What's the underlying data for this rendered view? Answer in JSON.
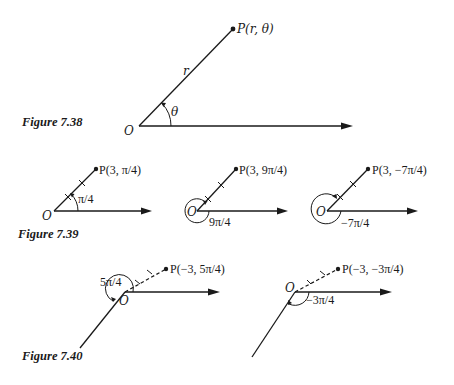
{
  "figures": {
    "fig738": {
      "caption": "Figure 7.38",
      "origin_label": "O",
      "point_label": "P(r, θ)",
      "radius_label": "r",
      "angle_label": "θ"
    },
    "fig739": {
      "caption": "Figure 7.39",
      "panels": [
        {
          "origin_label": "O",
          "point_label": "P(3, π/4)",
          "angle_label": "π/4"
        },
        {
          "origin_label": "O",
          "point_label": "P(3, 9π/4)",
          "angle_label": "9π/4"
        },
        {
          "origin_label": "O",
          "point_label": "P(3, −7π/4)",
          "angle_label": "−7π/4"
        }
      ]
    },
    "fig740": {
      "caption": "Figure 7.40",
      "panels": [
        {
          "origin_label": "O",
          "point_label": "P(−3, 5π/4)",
          "angle_label": "5π/4"
        },
        {
          "origin_label": "O",
          "point_label": "P(−3, −3π/4)",
          "angle_label": "−3π/4"
        }
      ]
    }
  },
  "colors": {
    "ink": "#1a1a1a",
    "background": "#ffffff"
  }
}
